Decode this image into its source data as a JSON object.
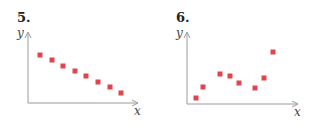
{
  "chart_data": [
    {
      "type": "scatter",
      "title": "5.",
      "xlabel": "x",
      "ylabel": "y",
      "grid": false,
      "x": [
        1,
        2,
        3,
        4,
        5,
        6,
        7,
        8
      ],
      "y": [
        8,
        7.1,
        6.1,
        5.3,
        4.4,
        3.4,
        2.5,
        1.5
      ],
      "xlim": [
        0,
        10
      ],
      "ylim": [
        0,
        12
      ],
      "marker_color": "#e0454f",
      "px_points": [
        [
          40,
          55
        ],
        [
          52,
          60
        ],
        [
          63,
          66
        ],
        [
          75,
          71
        ],
        [
          86,
          76
        ],
        [
          98,
          82
        ],
        [
          110,
          87
        ],
        [
          121,
          93
        ]
      ]
    },
    {
      "type": "scatter",
      "title": "6.",
      "xlabel": "x",
      "ylabel": "y",
      "grid": false,
      "x": [
        1,
        1.7,
        3.4,
        4.4,
        5.3,
        6.9,
        7.9,
        8.7
      ],
      "y": [
        1,
        2.8,
        5.1,
        4.9,
        3.6,
        2.6,
        4.3,
        8.8
      ],
      "xlim": [
        0,
        10
      ],
      "ylim": [
        0,
        12
      ],
      "marker_color": "#e0454f",
      "px_points": [
        [
          35,
          98
        ],
        [
          42,
          87
        ],
        [
          59,
          74
        ],
        [
          69,
          76
        ],
        [
          78,
          83
        ],
        [
          94,
          88
        ],
        [
          103,
          78
        ],
        [
          112,
          52
        ]
      ]
    }
  ]
}
